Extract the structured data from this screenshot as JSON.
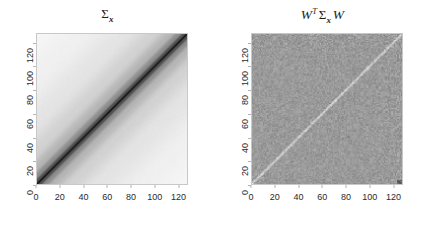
{
  "figure": {
    "background_color": "#ffffff",
    "width": 431,
    "height": 225,
    "layout": "two side-by-side square grayscale matrix images"
  },
  "chart_data": [
    {
      "type": "heatmap",
      "panel": "left",
      "title": "Σx",
      "title_parts": {
        "sigma": "Σ",
        "subscript": "x"
      },
      "xlabel": "",
      "ylabel": "",
      "xlim": [
        0,
        128
      ],
      "ylim": [
        0,
        128
      ],
      "xticks": [
        0,
        20,
        40,
        60,
        80,
        100,
        120
      ],
      "yticks": [
        0,
        20,
        40,
        60,
        80,
        100,
        120
      ],
      "xticklabels": [
        "0",
        "20",
        "40",
        "60",
        "80",
        "100",
        "120"
      ],
      "yticklabels": [
        "0",
        "20",
        "40",
        "60",
        "80",
        "100",
        "120"
      ],
      "grid": false,
      "legend": "none",
      "colormap": "grayscale_reversed",
      "matrix_size": 128,
      "structure": "banded Toeplitz covariance; value depends on |i-j|",
      "band_profile": [
        {
          "offset": 0,
          "gray_hex": "#101010",
          "level": 1.0
        },
        {
          "offset": 2,
          "gray_hex": "#4a4a4a",
          "level": 0.78
        },
        {
          "offset": 6,
          "gray_hex": "#8a8a8a",
          "level": 0.55
        },
        {
          "offset": 14,
          "gray_hex": "#b6b6b6",
          "level": 0.38
        },
        {
          "offset": 28,
          "gray_hex": "#d2d2d2",
          "level": 0.24
        },
        {
          "offset": 52,
          "gray_hex": "#e4e4e4",
          "level": 0.13
        },
        {
          "offset": 90,
          "gray_hex": "#f0f0f0",
          "level": 0.05
        },
        {
          "offset": 128,
          "gray_hex": "#f6f6f6",
          "level": 0.0
        }
      ],
      "diagonal_color": "#101010",
      "corner_color": "#f4f4f4"
    },
    {
      "type": "heatmap",
      "panel": "right",
      "title": "W^T Σx W",
      "title_parts": {
        "w_left": "𝒲",
        "transpose": "T",
        "sigma": "Σ",
        "subscript": "x",
        "w_right": "𝒲"
      },
      "xlabel": "",
      "ylabel": "",
      "xlim": [
        0,
        128
      ],
      "ylim": [
        0,
        128
      ],
      "xticks": [
        0,
        20,
        40,
        60,
        80,
        100,
        120
      ],
      "yticks": [
        0,
        20,
        40,
        60,
        80,
        100,
        120
      ],
      "xticklabels": [
        "0",
        "20",
        "40",
        "60",
        "80",
        "100",
        "120"
      ],
      "yticklabels": [
        "0",
        "20",
        "40",
        "60",
        "80",
        "100",
        "120"
      ],
      "grid": false,
      "legend": "none",
      "colormap": "grayscale_reversed",
      "matrix_size": 128,
      "structure": "wavelet-transformed covariance; near-diagonal sparse with faint dyadic block texture",
      "background_gray_hex": "#9a9a9a",
      "diagonal_highlight_hex": "#bfbfbf",
      "noise_amplitude": 0.06,
      "features": [
        "bright thin main diagonal from bottom-left to top-right",
        "faint dotted off-diagonal streaks in lower-left region",
        "dyadic block texture concentrated near high-index corner",
        "fine speckle noise across full field"
      ]
    }
  ],
  "panels": [
    {
      "name": "sigma-x-panel",
      "title_text": "Σx"
    },
    {
      "name": "wt-sigma-x-w-panel",
      "title_text": "Wᵀ Σx W"
    }
  ]
}
